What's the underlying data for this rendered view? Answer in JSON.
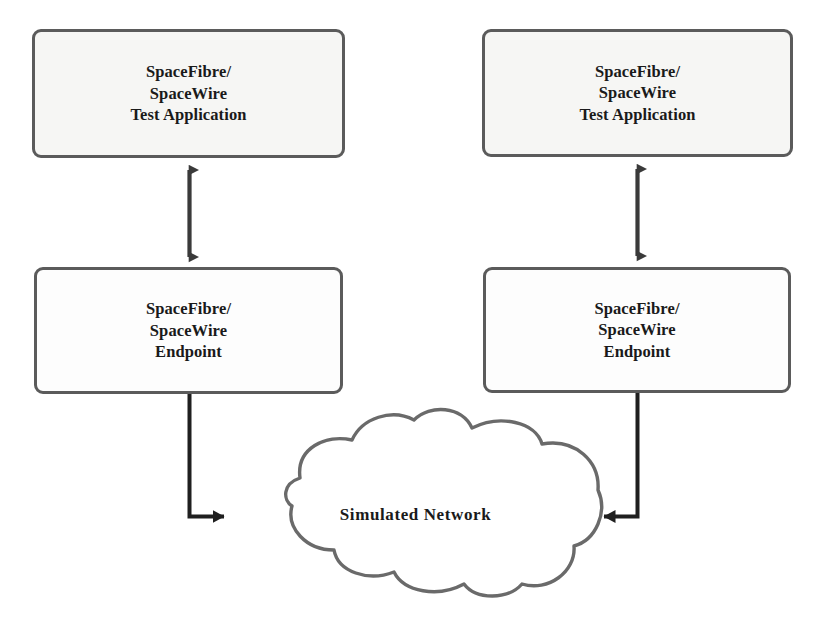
{
  "diagram": {
    "type": "block-diagram",
    "background_color": "#ffffff",
    "colors": {
      "box_border": "#5b5b5b",
      "box_fill_shaded": "#f6f6f4",
      "box_fill_plain": "#fdfdfd",
      "cloud_stroke": "#6a6a6a",
      "arrow": "#2b2b2b",
      "text": "#1a1a1a"
    },
    "nodes": [
      {
        "id": "app-left",
        "label": "SpaceFibre/\nSpaceWire\nTest Application",
        "lines": [
          "SpaceFibre/",
          "SpaceWire",
          "Test Application"
        ],
        "shape": "rounded-rectangle",
        "side": "left",
        "row": "top"
      },
      {
        "id": "app-right",
        "label": "SpaceFibre/\nSpaceWire\nTest Application",
        "lines": [
          "SpaceFibre/",
          "SpaceWire",
          "Test Application"
        ],
        "shape": "rounded-rectangle",
        "side": "right",
        "row": "top"
      },
      {
        "id": "endpoint-left",
        "label": "SpaceFibre/\nSpaceWire\nEndpoint",
        "lines": [
          "SpaceFibre/",
          "SpaceWire",
          "Endpoint"
        ],
        "shape": "rounded-rectangle",
        "side": "left",
        "row": "bottom"
      },
      {
        "id": "endpoint-right",
        "label": "SpaceFibre/\nSpaceWire\nEndpoint",
        "lines": [
          "SpaceFibre/",
          "SpaceWire",
          "Endpoint"
        ],
        "shape": "rounded-rectangle",
        "side": "right",
        "row": "bottom"
      },
      {
        "id": "network-cloud",
        "label": "Simulated Network",
        "shape": "cloud",
        "side": "center",
        "row": "network"
      }
    ],
    "connections": [
      {
        "id": "app-left-to-endpoint-left",
        "from": "app-left",
        "to": "endpoint-left",
        "style": "double-headed-arrow",
        "orientation": "vertical"
      },
      {
        "id": "app-right-to-endpoint-right",
        "from": "app-right",
        "to": "endpoint-right",
        "style": "double-headed-arrow",
        "orientation": "vertical"
      },
      {
        "id": "endpoint-left-to-network",
        "from": "endpoint-left",
        "to": "network-cloud",
        "style": "single-headed-arrow",
        "orientation": "elbow-down-right"
      },
      {
        "id": "endpoint-right-to-network",
        "from": "endpoint-right",
        "to": "network-cloud",
        "style": "single-headed-arrow",
        "orientation": "elbow-down-left"
      }
    ]
  }
}
